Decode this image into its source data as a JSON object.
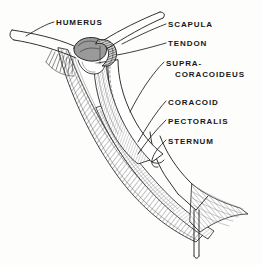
{
  "figure": {
    "kind": "anatomical-line-drawing",
    "background_color": "#fdfdfc",
    "ink_color": "#1a1a1a",
    "muscle_hatch_color": "#6f6f6f"
  },
  "labels": [
    {
      "id": "humerus",
      "text": "HUMERUS",
      "x": 56,
      "y": 18
    },
    {
      "id": "scapula",
      "text": "SCAPULA",
      "x": 168,
      "y": 20
    },
    {
      "id": "tendon",
      "text": "TENDON",
      "x": 168,
      "y": 39
    },
    {
      "id": "supracoracoideus",
      "line1": "SUPRA-",
      "line2": "CORACOIDEUS",
      "x": 166,
      "y": 58
    },
    {
      "id": "coracoid",
      "text": "CORACOID",
      "x": 168,
      "y": 98
    },
    {
      "id": "pectoralis",
      "text": "PECTORALIS",
      "x": 168,
      "y": 117
    },
    {
      "id": "sternum",
      "text": "STERNUM",
      "x": 168,
      "y": 137
    }
  ],
  "structures": [
    {
      "id": "humerus",
      "name": "humerus bone"
    },
    {
      "id": "scapula",
      "name": "scapula bone"
    },
    {
      "id": "tendon",
      "name": "supracoracoideus tendon"
    },
    {
      "id": "supracoracoideus",
      "name": "supracoracoideus muscle"
    },
    {
      "id": "coracoid",
      "name": "coracoid bone"
    },
    {
      "id": "pectoralis",
      "name": "pectoralis muscle"
    },
    {
      "id": "sternum",
      "name": "sternum with keel"
    }
  ]
}
